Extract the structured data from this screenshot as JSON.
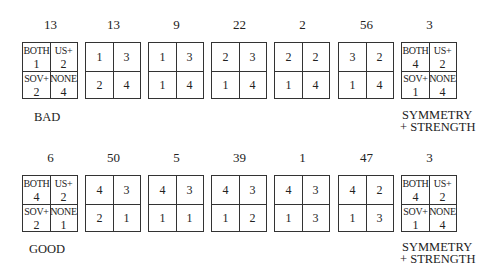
{
  "labels": {
    "both": "BOTH",
    "us": "US+",
    "sov": "SOV+",
    "none": "NONE"
  },
  "rows": [
    {
      "caption": "BAD",
      "end_caption_line1": "SYMMETRY",
      "end_caption_line2": "+ STRENGTH",
      "boxes": [
        {
          "count": "13",
          "cells": [
            "1",
            "2",
            "2",
            "4"
          ],
          "labeled": true
        },
        {
          "count": "13",
          "cells": [
            "1",
            "3",
            "2",
            "4"
          ],
          "labeled": false
        },
        {
          "count": "9",
          "cells": [
            "1",
            "3",
            "1",
            "4"
          ],
          "labeled": false
        },
        {
          "count": "22",
          "cells": [
            "2",
            "3",
            "1",
            "4"
          ],
          "labeled": false
        },
        {
          "count": "2",
          "cells": [
            "2",
            "2",
            "1",
            "4"
          ],
          "labeled": false
        },
        {
          "count": "56",
          "cells": [
            "3",
            "2",
            "1",
            "4"
          ],
          "labeled": false
        },
        {
          "count": "3",
          "cells": [
            "4",
            "2",
            "1",
            "4"
          ],
          "labeled": true
        }
      ]
    },
    {
      "caption": "GOOD",
      "end_caption_line1": "SYMMETRY",
      "end_caption_line2": "+ STRENGTH",
      "boxes": [
        {
          "count": "6",
          "cells": [
            "4",
            "2",
            "2",
            "1"
          ],
          "labeled": true
        },
        {
          "count": "50",
          "cells": [
            "4",
            "3",
            "2",
            "1"
          ],
          "labeled": false
        },
        {
          "count": "5",
          "cells": [
            "4",
            "3",
            "1",
            "1"
          ],
          "labeled": false
        },
        {
          "count": "39",
          "cells": [
            "4",
            "3",
            "1",
            "2"
          ],
          "labeled": false
        },
        {
          "count": "1",
          "cells": [
            "4",
            "3",
            "1",
            "3"
          ],
          "labeled": false
        },
        {
          "count": "47",
          "cells": [
            "4",
            "2",
            "1",
            "3"
          ],
          "labeled": false
        },
        {
          "count": "3",
          "cells": [
            "4",
            "2",
            "1",
            "4"
          ],
          "labeled": true
        }
      ]
    }
  ]
}
